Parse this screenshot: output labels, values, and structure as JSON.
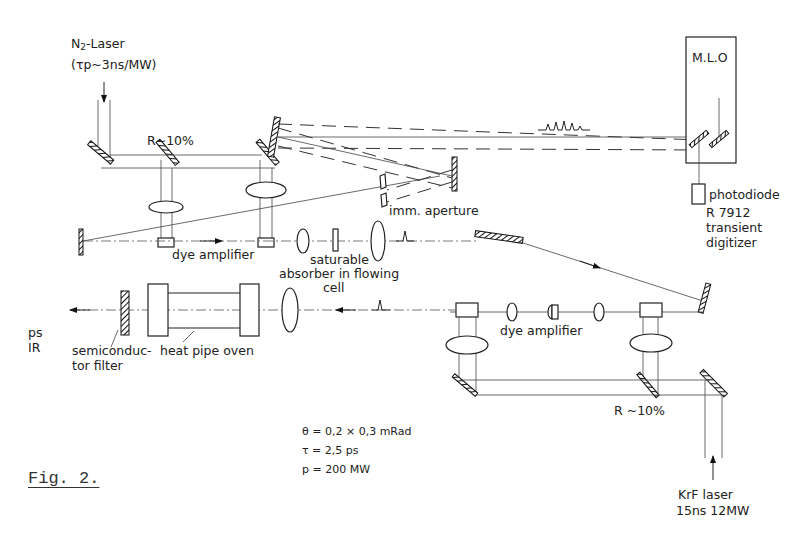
{
  "figure": {
    "caption": "Fig. 2.",
    "type": "optical setup schematic"
  },
  "sources": {
    "n2_laser": {
      "name": "N",
      "name_sub": "2",
      "name_rest": "-Laser",
      "spec": "(τp~3ns/MW)"
    },
    "krf_laser": {
      "line1": "KrF  laser",
      "line2": "15ns  12MW"
    }
  },
  "labels": {
    "beamsplitter_top": "R~10%",
    "beamsplitter_bottom": "R ~10%",
    "mlo": "M.L.O",
    "photodiode": "photodiode",
    "digitizer": [
      "R 7912",
      "transient",
      "digitizer"
    ],
    "imm_aperture": "imm. aperture",
    "dye_amplifier_top": "dye amplifier",
    "dye_amplifier_bottom": "dye amplifier",
    "saturable_absorber": [
      "saturable",
      "absorber in flowing",
      "cell"
    ],
    "output": [
      "ps",
      "IR"
    ],
    "semiconductor_filter": [
      "semiconduc-",
      "tor filter"
    ],
    "heat_pipe_oven": "heat pipe oven"
  },
  "parameters": [
    "θ = 0,2 × 0,3 mRad",
    "τ = 2,5 ps",
    "p = 200 MW"
  ]
}
